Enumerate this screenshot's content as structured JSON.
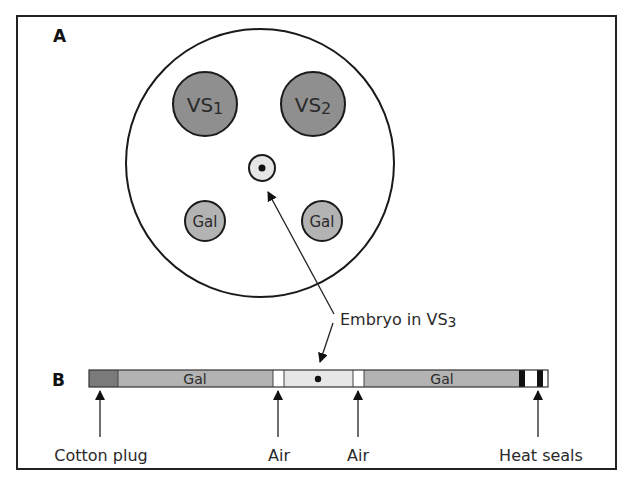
{
  "panels": {
    "a": {
      "label": "A"
    },
    "b": {
      "label": "B"
    }
  },
  "dish": {
    "drops": [
      {
        "id": "vs1",
        "label": "VS1",
        "main": "VS",
        "sub": "1"
      },
      {
        "id": "vs2",
        "label": "VS2",
        "main": "VS",
        "sub": "2"
      },
      {
        "id": "gal-left",
        "label": "Gal"
      },
      {
        "id": "gal-right",
        "label": "Gal"
      }
    ]
  },
  "callout": {
    "label": "Embryo in VS3",
    "main": "Embryo in VS",
    "sub": "3"
  },
  "straw": {
    "segments": [
      {
        "name": "cotton-plug",
        "label": ""
      },
      {
        "name": "gal",
        "label": "Gal"
      },
      {
        "name": "air",
        "label": ""
      },
      {
        "name": "vs3-embryo",
        "label": ""
      },
      {
        "name": "air",
        "label": ""
      },
      {
        "name": "gal",
        "label": "Gal"
      },
      {
        "name": "heat-seal",
        "label": ""
      },
      {
        "name": "gap",
        "label": ""
      },
      {
        "name": "heat-seal",
        "label": ""
      },
      {
        "name": "end",
        "label": ""
      }
    ],
    "annotations": [
      {
        "label": "Cotton plug"
      },
      {
        "label": "Air"
      },
      {
        "label": "Air"
      },
      {
        "label": "Heat seals"
      }
    ]
  },
  "colors": {
    "dark_gray": "#7a7a7a",
    "vs_fill": "#8f8f8f",
    "gal_fill": "#b3b3b3",
    "vs3_fill": "#e6e6e6",
    "seal": "#111111",
    "stroke": "#1a1a1a"
  }
}
